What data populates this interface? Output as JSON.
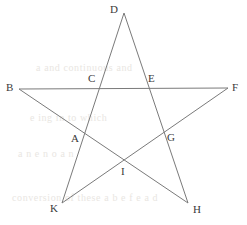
{
  "figure": {
    "background_color": "#ffffff",
    "line_color": "#7a7a7a",
    "label_color": "#3a3a3a",
    "line_width": 1,
    "canvas": {
      "width": 247,
      "height": 225
    }
  },
  "points": [
    {
      "id": "D",
      "label": "D",
      "role": "star-tip-top",
      "x": 124,
      "y": 13,
      "label_x": 110,
      "label_y": 4
    },
    {
      "id": "B",
      "label": "B",
      "role": "star-tip-left",
      "x": 19,
      "y": 89,
      "label_x": 6,
      "label_y": 82
    },
    {
      "id": "F",
      "label": "F",
      "role": "star-tip-right",
      "x": 228,
      "y": 88,
      "label_x": 232,
      "label_y": 82
    },
    {
      "id": "K",
      "label": "K",
      "role": "star-tip-bottom-left",
      "x": 62,
      "y": 203,
      "label_x": 50,
      "label_y": 203
    },
    {
      "id": "H",
      "label": "H",
      "role": "star-tip-bottom-right",
      "x": 188,
      "y": 203,
      "label_x": 193,
      "label_y": 204
    },
    {
      "id": "C",
      "label": "C",
      "role": "inner-intersection",
      "x": 99,
      "y": 88,
      "label_x": 88,
      "label_y": 73
    },
    {
      "id": "E",
      "label": "E",
      "role": "inner-intersection",
      "x": 147,
      "y": 88,
      "label_x": 148,
      "label_y": 73
    },
    {
      "id": "A",
      "label": "A",
      "role": "inner-intersection",
      "x": 82,
      "y": 134,
      "label_x": 71,
      "label_y": 133
    },
    {
      "id": "G",
      "label": "G",
      "role": "inner-intersection",
      "x": 164,
      "y": 133,
      "label_x": 167,
      "label_y": 132
    },
    {
      "id": "I",
      "label": "I",
      "role": "inner-intersection",
      "x": 124,
      "y": 160,
      "label_x": 121,
      "label_y": 166
    }
  ],
  "segments": [
    {
      "id": "seg-B-F",
      "from": "B",
      "to": "F",
      "x1": 19,
      "y1": 89,
      "x2": 228,
      "y2": 88
    },
    {
      "id": "seg-B-H",
      "from": "B",
      "to": "H",
      "x1": 19,
      "y1": 89,
      "x2": 188,
      "y2": 203
    },
    {
      "id": "seg-F-K",
      "from": "F",
      "to": "K",
      "x1": 228,
      "y1": 88,
      "x2": 62,
      "y2": 203
    },
    {
      "id": "seg-D-K",
      "from": "D",
      "to": "K",
      "x1": 124,
      "y1": 13,
      "x2": 62,
      "y2": 203
    },
    {
      "id": "seg-D-H",
      "from": "D",
      "to": "H",
      "x1": 124,
      "y1": 13,
      "x2": 188,
      "y2": 203
    }
  ],
  "bleed_text": [
    {
      "text": "a and continuous and",
      "x": 36,
      "y": 62
    },
    {
      "text": "e  ing   in  to  which",
      "x": 30,
      "y": 112
    },
    {
      "text": "a    n  e   n   o   a  n",
      "x": 18,
      "y": 148
    },
    {
      "text": "conversion of  these  a  b  e  f  e  a  d",
      "x": 12,
      "y": 192
    }
  ]
}
